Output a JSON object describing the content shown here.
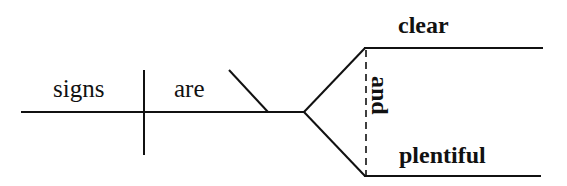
{
  "diagram": {
    "type": "sentence-diagram",
    "sentence": "signs are clear and plentiful",
    "subject": {
      "text": "signs"
    },
    "verb": {
      "text": "are"
    },
    "predicate_complements": [
      {
        "text": "clear"
      },
      {
        "text": "plentiful"
      }
    ],
    "conjunction": {
      "text": "and"
    },
    "colors": {
      "ink": "#111111",
      "background": "#ffffff"
    }
  }
}
